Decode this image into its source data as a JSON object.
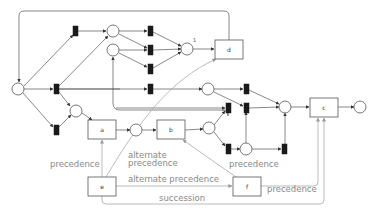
{
  "diagram": {
    "type": "petri-net-with-declare-constraints",
    "colors": {
      "arc": "#555555",
      "declare": "#aaaaaa",
      "transition": "#1a1a1a",
      "label": "#888888"
    },
    "places": [
      {
        "id": "p_start",
        "x": 18,
        "y": 89,
        "r": 6
      },
      {
        "id": "p1",
        "x": 113,
        "y": 31,
        "r": 6
      },
      {
        "id": "p2",
        "x": 113,
        "y": 50,
        "r": 6
      },
      {
        "id": "p3",
        "x": 187,
        "y": 49,
        "r": 6,
        "label": "1"
      },
      {
        "id": "p4",
        "x": 76,
        "y": 111,
        "r": 6
      },
      {
        "id": "p5",
        "x": 208,
        "y": 89,
        "r": 6
      },
      {
        "id": "p6",
        "x": 136,
        "y": 130,
        "r": 6
      },
      {
        "id": "p7",
        "x": 209,
        "y": 128,
        "r": 6
      },
      {
        "id": "p8",
        "x": 246,
        "y": 149,
        "r": 6
      },
      {
        "id": "p9",
        "x": 285,
        "y": 107,
        "r": 6
      },
      {
        "id": "p_end",
        "x": 360,
        "y": 107,
        "r": 6
      }
    ],
    "transitions": [
      {
        "id": "t1",
        "x": 75,
        "y": 31
      },
      {
        "id": "t2",
        "x": 56,
        "y": 89
      },
      {
        "id": "t3",
        "x": 56,
        "y": 130
      },
      {
        "id": "t4",
        "x": 150,
        "y": 31
      },
      {
        "id": "t5",
        "x": 150,
        "y": 50
      },
      {
        "id": "t6",
        "x": 150,
        "y": 69
      },
      {
        "id": "t7",
        "x": 150,
        "y": 89
      },
      {
        "id": "t8",
        "x": 246,
        "y": 89
      },
      {
        "id": "t9",
        "x": 228,
        "y": 108
      },
      {
        "id": "t10",
        "x": 246,
        "y": 108
      },
      {
        "id": "t11",
        "x": 228,
        "y": 149
      },
      {
        "id": "t12",
        "x": 284,
        "y": 149
      }
    ],
    "activities": [
      {
        "id": "a",
        "label": "a",
        "x": 88,
        "y": 120,
        "w": 28,
        "h": 19
      },
      {
        "id": "b",
        "label": "b",
        "x": 157,
        "y": 120,
        "w": 28,
        "h": 19
      },
      {
        "id": "c",
        "label": "c",
        "x": 310,
        "y": 98,
        "w": 28,
        "h": 19
      },
      {
        "id": "d",
        "label": "d",
        "x": 215,
        "y": 40,
        "w": 28,
        "h": 19
      },
      {
        "id": "e",
        "label": "e",
        "x": 88,
        "y": 177,
        "w": 28,
        "h": 19
      },
      {
        "id": "f",
        "label": "f",
        "x": 233,
        "y": 177,
        "w": 28,
        "h": 19
      }
    ],
    "constraints": [
      {
        "id": "c1",
        "type": "precedence",
        "label": "precedence",
        "from": "e",
        "to": "a",
        "label_x": 19,
        "label_y": 167
      },
      {
        "id": "c2",
        "type": "alternate precedence",
        "label": "alternate precedence",
        "from": "e",
        "to": "d",
        "label_x": 128,
        "label_y": 158,
        "label_lines": [
          "alternate",
          "precedence"
        ]
      },
      {
        "id": "c3",
        "type": "alternate precedence",
        "label": "alternate precedence",
        "from": "e",
        "to": "f",
        "label_x": 128,
        "label_y": 182
      },
      {
        "id": "c4",
        "type": "precedence",
        "label": "precedence",
        "from": "f",
        "to": "b",
        "label_x": 229,
        "label_y": 167
      },
      {
        "id": "c5",
        "type": "precedence",
        "label": "precedence",
        "from": "f",
        "to": "c",
        "label_x": 267,
        "label_y": 192
      },
      {
        "id": "c6",
        "type": "succession",
        "label": "succession",
        "from": "e",
        "to": "c",
        "label_x": 159,
        "label_y": 204
      }
    ]
  }
}
